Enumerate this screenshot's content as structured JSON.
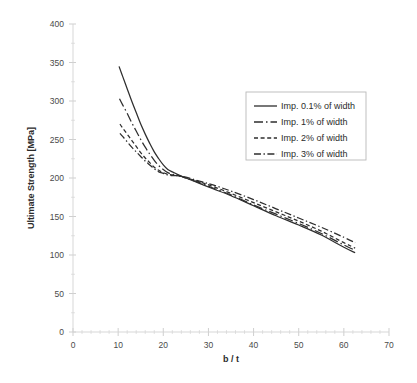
{
  "chart_data": {
    "type": "line",
    "title": "",
    "xlabel": "b / t",
    "ylabel": "Ultimate Strength [MPa]",
    "xlim": [
      0,
      70
    ],
    "ylim": [
      0,
      400
    ],
    "xticks": [
      "0",
      "10",
      "20",
      "30",
      "40",
      "50",
      "60",
      "70"
    ],
    "yticks": [
      "0",
      "50",
      "100",
      "150",
      "200",
      "250",
      "300",
      "350",
      "400"
    ],
    "grid": false,
    "legend_position": "upper-right",
    "series": [
      {
        "name": "Imp. 0.1% of width",
        "style": "solid",
        "x": [
          10.2,
          11,
          12,
          13,
          14,
          15,
          16,
          17,
          18,
          19,
          20,
          21,
          22,
          23,
          25,
          28,
          31,
          35,
          40,
          45,
          50,
          55,
          60,
          62.5
        ],
        "y": [
          345,
          332,
          316,
          300,
          285,
          270,
          257,
          245,
          234,
          225,
          217,
          211,
          208,
          205,
          200,
          193,
          186,
          177,
          164,
          151,
          139,
          126,
          110,
          103
        ]
      },
      {
        "name": "Imp. 1% of width",
        "style": "dash-dot-long",
        "x": [
          10.3,
          11,
          12,
          13,
          14,
          15,
          16,
          17,
          18,
          19,
          20,
          21,
          22,
          23,
          25,
          28,
          31,
          35,
          40,
          45,
          50,
          55,
          60,
          62.5
        ],
        "y": [
          303,
          295,
          284,
          272,
          261,
          250,
          240,
          231,
          223,
          216,
          211,
          207,
          205,
          204,
          200,
          194,
          187,
          178,
          165,
          153,
          141,
          128,
          113,
          106
        ]
      },
      {
        "name": "Imp. 2% of width",
        "style": "dashed",
        "x": [
          10.4,
          11,
          12,
          13,
          14,
          15,
          16,
          17,
          18,
          19,
          20,
          21,
          22,
          23,
          25,
          28,
          31,
          35,
          40,
          45,
          50,
          55,
          60,
          62.5
        ],
        "y": [
          270,
          265,
          257,
          249,
          241,
          233,
          226,
          220,
          214,
          210,
          207,
          205,
          204,
          203,
          200,
          195,
          189,
          180,
          168,
          156,
          144,
          131,
          116,
          109
        ]
      },
      {
        "name": "Imp. 3% of width",
        "style": "dash-dot",
        "x": [
          10.4,
          11,
          12,
          13,
          14,
          15,
          16,
          17,
          18,
          19,
          20,
          21,
          22,
          23,
          25,
          28,
          31,
          35,
          40,
          45,
          50,
          55,
          60,
          62.5
        ],
        "y": [
          258,
          254,
          247,
          240,
          234,
          228,
          222,
          217,
          212,
          208,
          206,
          204,
          203,
          203,
          201,
          196,
          191,
          183,
          172,
          160,
          148,
          136,
          123,
          116
        ]
      }
    ]
  },
  "axes": {
    "x_title": "b / t",
    "y_title": "Ultimate Strength [MPa]"
  },
  "legend": {
    "entries": [
      {
        "label": "Imp. 0.1% of width",
        "style": "solid"
      },
      {
        "label": "Imp. 1% of width",
        "style": "dash-dot-long"
      },
      {
        "label": "Imp. 2% of width",
        "style": "dashed"
      },
      {
        "label": "Imp. 3% of width",
        "style": "dash-dot"
      }
    ]
  },
  "colors": {
    "curve": "#2e2e2e",
    "axis": "#d2d2d2",
    "legend_border": "#b9b9b9",
    "background": "#ffffff",
    "tick_label": "#4a4a4a"
  }
}
